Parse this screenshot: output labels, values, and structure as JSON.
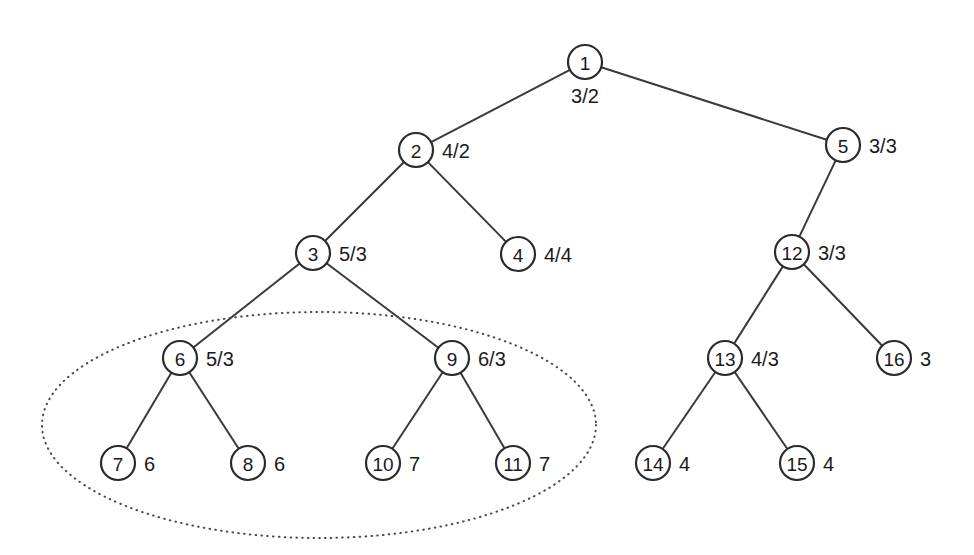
{
  "figure": {
    "kind": "tree-diagram",
    "background_color": "#ffffff",
    "node_stroke_color": "#2b2b2b",
    "edge_color": "#3a3a3a",
    "selection_color": "#4a4a4a",
    "node_radius": 17
  },
  "nodes": [
    {
      "id": "1",
      "x": 585,
      "y": 62,
      "label": "3/2",
      "label_pos": "below"
    },
    {
      "id": "2",
      "x": 416,
      "y": 150,
      "label": "4/2",
      "label_pos": "right"
    },
    {
      "id": "5",
      "x": 843,
      "y": 145,
      "label": "3/3",
      "label_pos": "right"
    },
    {
      "id": "3",
      "x": 313,
      "y": 253,
      "label": "5/3",
      "label_pos": "right"
    },
    {
      "id": "4",
      "x": 518,
      "y": 254,
      "label": "4/4",
      "label_pos": "right"
    },
    {
      "id": "12",
      "x": 792,
      "y": 252,
      "label": "3/3",
      "label_pos": "right"
    },
    {
      "id": "6",
      "x": 180,
      "y": 358,
      "label": "5/3",
      "label_pos": "right"
    },
    {
      "id": "9",
      "x": 452,
      "y": 358,
      "label": "6/3",
      "label_pos": "right"
    },
    {
      "id": "13",
      "x": 725,
      "y": 358,
      "label": "4/3",
      "label_pos": "right"
    },
    {
      "id": "16",
      "x": 894,
      "y": 358,
      "label": "3",
      "label_pos": "right"
    },
    {
      "id": "7",
      "x": 118,
      "y": 463,
      "label": "6",
      "label_pos": "right"
    },
    {
      "id": "8",
      "x": 248,
      "y": 463,
      "label": "6",
      "label_pos": "right"
    },
    {
      "id": "10",
      "x": 383,
      "y": 463,
      "label": "7",
      "label_pos": "right"
    },
    {
      "id": "11",
      "x": 513,
      "y": 463,
      "label": "7",
      "label_pos": "right"
    },
    {
      "id": "14",
      "x": 653,
      "y": 463,
      "label": "4",
      "label_pos": "right"
    },
    {
      "id": "15",
      "x": 797,
      "y": 463,
      "label": "4",
      "label_pos": "right"
    }
  ],
  "edges": [
    {
      "from": "1",
      "to": "2"
    },
    {
      "from": "1",
      "to": "5"
    },
    {
      "from": "2",
      "to": "3"
    },
    {
      "from": "2",
      "to": "4"
    },
    {
      "from": "3",
      "to": "6"
    },
    {
      "from": "3",
      "to": "9"
    },
    {
      "from": "5",
      "to": "12"
    },
    {
      "from": "12",
      "to": "13"
    },
    {
      "from": "12",
      "to": "16"
    },
    {
      "from": "6",
      "to": "7"
    },
    {
      "from": "6",
      "to": "8"
    },
    {
      "from": "9",
      "to": "10"
    },
    {
      "from": "9",
      "to": "11"
    },
    {
      "from": "13",
      "to": "14"
    },
    {
      "from": "13",
      "to": "15"
    }
  ],
  "selection": {
    "shape": "ellipse",
    "cx": 319,
    "cy": 425,
    "rx": 277,
    "ry": 113,
    "style": "dotted",
    "encloses": [
      "6",
      "7",
      "8",
      "9",
      "10",
      "11"
    ]
  }
}
